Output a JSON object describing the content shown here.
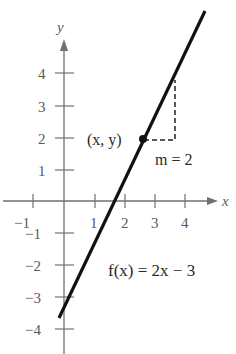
{
  "axes": {
    "x_label": "x",
    "y_label": "y",
    "x_ticks": [
      {
        "value": -1,
        "label": "−1"
      },
      {
        "value": 1,
        "label": "1"
      },
      {
        "value": 2,
        "label": "2"
      },
      {
        "value": 3,
        "label": "3"
      },
      {
        "value": 4,
        "label": "4"
      }
    ],
    "y_ticks": [
      {
        "value": 4,
        "label": "4"
      },
      {
        "value": 3,
        "label": "3"
      },
      {
        "value": 2,
        "label": "2"
      },
      {
        "value": 1,
        "label": "1"
      },
      {
        "value": -1,
        "label": "−1"
      },
      {
        "value": -2,
        "label": "−2"
      },
      {
        "value": -3,
        "label": "−3"
      },
      {
        "value": -4,
        "label": "−4"
      }
    ]
  },
  "annotations": {
    "point_label": "(x, y)",
    "slope_label": "m = 2",
    "function_label": "f(x) = 2x − 3"
  },
  "colors": {
    "axis": "#6e6e6e",
    "line": "#111111",
    "text": "#5a5a5a"
  }
}
